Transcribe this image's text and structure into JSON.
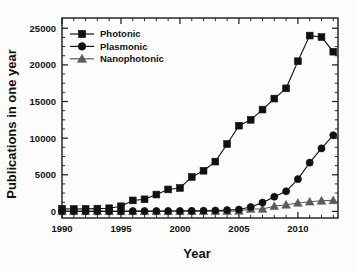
{
  "chart_data": {
    "type": "line",
    "title": "",
    "xlabel": "Year",
    "ylabel": "Publications in one year",
    "xlim": [
      1990,
      2013.4
    ],
    "ylim": [
      -900,
      26400
    ],
    "grid": false,
    "legend_position": "top-left",
    "xticks": [
      1990,
      1995,
      2000,
      2005,
      2010
    ],
    "xticklabels": [
      "1990",
      "1995",
      "2000",
      "2005",
      "2010"
    ],
    "xtick_minor_step": 1,
    "yticks": [
      0,
      5000,
      10000,
      15000,
      20000,
      25000
    ],
    "yticklabels": [
      "0",
      "5000",
      "10000",
      "15000",
      "20000",
      "25000"
    ],
    "ytick_minor_step": 1250,
    "x": [
      1990,
      1991,
      1992,
      1993,
      1994,
      1995,
      1996,
      1997,
      1998,
      1999,
      2000,
      2001,
      2002,
      2003,
      2004,
      2005,
      2006,
      2007,
      2008,
      2009,
      2010,
      2011,
      2012,
      2013
    ],
    "series": [
      {
        "name": "Photonic",
        "marker": "square",
        "color": "#111111",
        "values": [
          350,
          330,
          350,
          380,
          430,
          700,
          1500,
          1650,
          2300,
          3000,
          3200,
          4700,
          5550,
          6800,
          9200,
          11700,
          12500,
          13900,
          15400,
          16800,
          20500,
          24000,
          23800,
          21800
        ]
      },
      {
        "name": "Plasmonic",
        "marker": "circle",
        "color": "#111111",
        "values": [
          20,
          20,
          25,
          25,
          30,
          30,
          35,
          40,
          45,
          50,
          60,
          70,
          90,
          120,
          170,
          260,
          600,
          1200,
          2000,
          2750,
          4400,
          6650,
          8600,
          10400
        ]
      },
      {
        "name": "Nanophotonic",
        "marker": "triangle",
        "color": "#5a5a5a",
        "values": [
          5,
          5,
          5,
          5,
          5,
          5,
          8,
          8,
          10,
          12,
          15,
          18,
          22,
          30,
          45,
          70,
          330,
          330,
          700,
          900,
          1150,
          1320,
          1450,
          1500
        ]
      }
    ]
  },
  "legend": {
    "items": [
      {
        "label": "Photonic"
      },
      {
        "label": "Plasmonic"
      },
      {
        "label": "Nanophotonic"
      }
    ]
  }
}
